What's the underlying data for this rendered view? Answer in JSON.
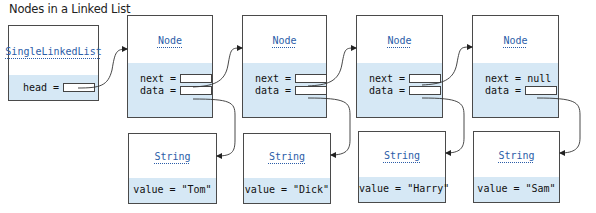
{
  "title": "Nodes in a Linked List",
  "list": {
    "class_name": "SingleLinkedList",
    "head_label": "head ="
  },
  "nodes": [
    {
      "class_name": "Node",
      "next_label": "next =",
      "data_label": "data ="
    },
    {
      "class_name": "Node",
      "next_label": "next =",
      "data_label": "data ="
    },
    {
      "class_name": "Node",
      "next_label": "next =",
      "data_label": "data ="
    },
    {
      "class_name": "Node",
      "next_label": "next = null",
      "data_label": "data ="
    }
  ],
  "strings": [
    {
      "class_name": "String",
      "value_text": "value = \"Tom\""
    },
    {
      "class_name": "String",
      "value_text": "value = \"Dick\""
    },
    {
      "class_name": "String",
      "value_text": "value = \"Harry\""
    },
    {
      "class_name": "String",
      "value_text": "value = \"Sam\""
    }
  ],
  "colors": {
    "field_background": "#d6e8f5",
    "class_name": "#2b5da8",
    "border": "#4a4a4a"
  }
}
